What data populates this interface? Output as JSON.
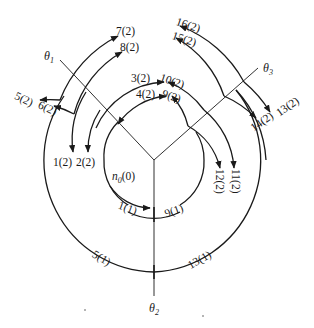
{
  "figure": {
    "type": "state-transition angular diagram",
    "center": {
      "x": 154,
      "y": 160
    },
    "axes": [
      {
        "id": "theta1",
        "label": "θ₁",
        "label_main": "θ",
        "label_sub": "1"
      },
      {
        "id": "theta2",
        "label": "θ₂",
        "label_main": "θ",
        "label_sub": "2"
      },
      {
        "id": "theta3",
        "label": "θ₃",
        "label_main": "θ",
        "label_sub": "3"
      }
    ],
    "origin_node": {
      "label": "n₀(0)",
      "main": "n",
      "sub": "0",
      "suffix": "(0)"
    },
    "level1_nodes": [
      {
        "label": "1(1)"
      },
      {
        "label": "9(1)"
      },
      {
        "label": "5(1)"
      },
      {
        "label": "13(1)"
      }
    ],
    "level2_nodes_left": [
      {
        "label": "1(2)"
      },
      {
        "label": "2(2)"
      },
      {
        "label": "3(2)"
      },
      {
        "label": "4(2)"
      },
      {
        "label": "5(2)"
      },
      {
        "label": "6(2)"
      },
      {
        "label": "7(2)"
      },
      {
        "label": "8(2)"
      }
    ],
    "level2_nodes_right": [
      {
        "label": "9(2)"
      },
      {
        "label": "10(2)"
      },
      {
        "label": "11(2)"
      },
      {
        "label": "12(2)"
      },
      {
        "label": "13(2)"
      },
      {
        "label": "14(2)"
      },
      {
        "label": "15(2)"
      },
      {
        "label": "16(2)"
      }
    ]
  }
}
